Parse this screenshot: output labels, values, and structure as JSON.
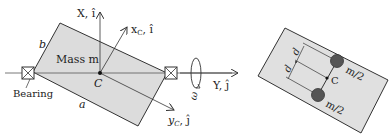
{
  "left_figure": {
    "labels": {
      "x_axis": "X, î",
      "xc_axis": "x",
      "xc_sub": "C",
      "xc_unit": ", î",
      "y_axis": "Y, ĵ",
      "yc_axis": "y",
      "yc_sub": "C",
      "yc_unit": ", ĵ",
      "b": "b",
      "a": "a",
      "mass": "Mass m",
      "center": "C",
      "bearing": "Bearing",
      "omega": "ω"
    },
    "colors": {
      "plate_fill": "#dcdcdc",
      "stroke": "#333333"
    }
  },
  "right_figure": {
    "labels": {
      "d_top": "d",
      "d_bottom": "d",
      "center": "C",
      "mass_top": "m/2",
      "mass_bottom": "m/2"
    },
    "colors": {
      "plate_fill": "#e0e0e0",
      "mass_fill": "#555555",
      "stroke": "#333333"
    }
  }
}
